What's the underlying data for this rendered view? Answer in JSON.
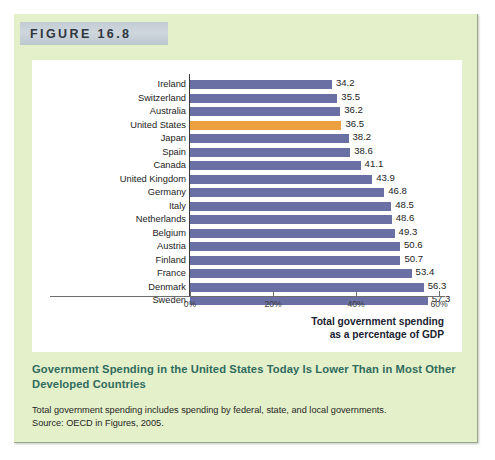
{
  "figure": {
    "number_label": "FIGURE 16.8",
    "caption_title": "Government Spending in the United States Today Is Lower Than in Most Other Developed Countries",
    "caption_note_line1": "Total government spending includes spending by federal, state, and local governments.",
    "caption_note_line2": "Source: OECD in Figures, 2005."
  },
  "colors": {
    "panel_background": "#e4f0c9",
    "band_background": "#c9d2d9",
    "bar": "#6a70a4",
    "bar_highlight": "#eda13e",
    "caption_title": "#2f6b5e"
  },
  "axis_title": {
    "line1": "Total government spending",
    "line2": "as a percentage of GDP"
  },
  "chart_data": {
    "type": "bar",
    "orientation": "horizontal",
    "title": "Government Spending in the United States Today Is Lower Than in Most Other Developed Countries",
    "xlabel": "Total government spending as a percentage of GDP",
    "ylabel": "",
    "xlim": [
      0,
      60
    ],
    "grid": false,
    "legend": "none",
    "highlight_category": "United States",
    "tick_labels": [
      "0%",
      "20%",
      "40%",
      "60%"
    ],
    "tick_values": [
      0,
      20,
      40,
      60
    ],
    "categories": [
      "Ireland",
      "Switzerland",
      "Australia",
      "United States",
      "Japan",
      "Spain",
      "Canada",
      "United Kingdom",
      "Germany",
      "Italy",
      "Netherlands",
      "Belgium",
      "Austria",
      "Finland",
      "France",
      "Denmark",
      "Sweden"
    ],
    "values": [
      34.2,
      35.5,
      36.2,
      36.5,
      38.2,
      38.6,
      41.1,
      43.9,
      46.8,
      48.5,
      48.6,
      49.3,
      50.6,
      50.7,
      53.4,
      56.3,
      57.3
    ],
    "value_labels": [
      "34.2",
      "35.5",
      "36.2",
      "36.5",
      "38.2",
      "38.6",
      "41.1",
      "43.9",
      "46.8",
      "48.5",
      "48.6",
      "49.3",
      "50.6",
      "50.7",
      "53.4",
      "56.3",
      "57.3"
    ]
  }
}
